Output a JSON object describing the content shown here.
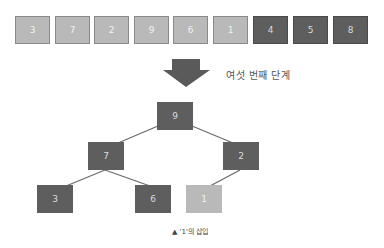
{
  "array": {
    "cells": [
      {
        "value": "3",
        "shade": "light"
      },
      {
        "value": "7",
        "shade": "light"
      },
      {
        "value": "2",
        "shade": "light"
      },
      {
        "value": "9",
        "shade": "light"
      },
      {
        "value": "6",
        "shade": "light"
      },
      {
        "value": "1",
        "shade": "light"
      },
      {
        "value": "4",
        "shade": "dark"
      },
      {
        "value": "5",
        "shade": "dark"
      },
      {
        "value": "8",
        "shade": "dark"
      }
    ]
  },
  "arrow": {
    "icon": "down-arrow-icon",
    "color": "#5a5a5a"
  },
  "step_label": "여섯 번째 단계",
  "tree": {
    "nodes": [
      {
        "id": "root",
        "value": "9",
        "shade": "dark"
      },
      {
        "id": "left",
        "value": "7",
        "shade": "dark"
      },
      {
        "id": "right",
        "value": "2",
        "shade": "dark"
      },
      {
        "id": "left-left",
        "value": "3",
        "shade": "dark"
      },
      {
        "id": "left-right",
        "value": "6",
        "shade": "dark"
      },
      {
        "id": "right-left",
        "value": "1",
        "shade": "light"
      }
    ]
  },
  "caption": "▲ '1'의 삽입",
  "colors": {
    "light": "#b9b9b9",
    "dark": "#5e5e5e",
    "edge": "#6a6a6a"
  }
}
